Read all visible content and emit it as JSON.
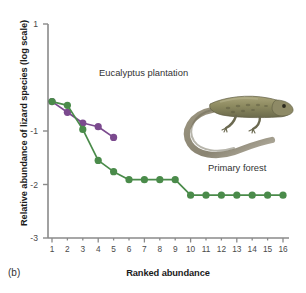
{
  "panel": {
    "label": "(b)"
  },
  "axes": {
    "ylabel": "Relative abundance of lizard species (log scale)",
    "xlabel": "Ranked abundance",
    "yticks": [
      "1",
      "-1",
      "-2",
      "-3"
    ],
    "ytick_values": [
      1,
      -1,
      -2,
      -3
    ],
    "xticks": [
      "1",
      "2",
      "3",
      "4",
      "5",
      "6",
      "7",
      "8",
      "9",
      "10",
      "11",
      "12",
      "13",
      "14",
      "15",
      "16"
    ]
  },
  "annotations": {
    "eucalyptus": "Eucalyptus plantation",
    "primary_forest": "Primary forest"
  },
  "colors": {
    "eucalyptus": "#7b4a8e",
    "primary_forest": "#4a8b4a",
    "axis": "#8a8a8a",
    "text": "#1b1b1b"
  },
  "photo": {
    "name": "lizard-photograph",
    "description": "Photograph of a lizard with a long curved tail",
    "body_color": "#8c8a62",
    "tail_color": "#9a9482"
  },
  "chart_data": {
    "type": "line",
    "title": "",
    "xlabel": "Ranked abundance",
    "ylabel": "Relative abundance of lizard species (log scale)",
    "xlim": [
      0.4,
      16.6
    ],
    "ylim": [
      -3,
      1
    ],
    "grid": false,
    "legend": "inline-annotations",
    "x": [
      1,
      2,
      3,
      4,
      5,
      6,
      7,
      8,
      9,
      10,
      11,
      12,
      13,
      14,
      15,
      16
    ],
    "series": [
      {
        "name": "Eucalyptus plantation",
        "color": "#7b4a8e",
        "x": [
          1,
          2,
          3,
          4,
          5
        ],
        "values": [
          -0.45,
          -0.65,
          -0.85,
          -0.92,
          -1.12
        ]
      },
      {
        "name": "Primary forest",
        "color": "#4a8b4a",
        "x": [
          1,
          2,
          3,
          4,
          5,
          6,
          7,
          8,
          9,
          10,
          11,
          12,
          13,
          14,
          15,
          16
        ],
        "values": [
          -0.45,
          -0.52,
          -0.97,
          -1.55,
          -1.76,
          -1.91,
          -1.91,
          -1.91,
          -1.91,
          -2.2,
          -2.2,
          -2.2,
          -2.2,
          -2.2,
          -2.2,
          -2.2
        ]
      }
    ]
  }
}
